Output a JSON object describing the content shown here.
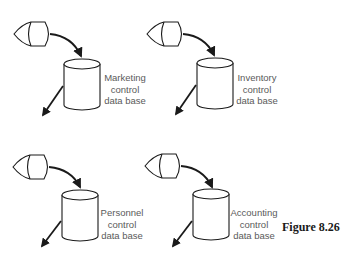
{
  "figure": {
    "caption": "Figure 8.26"
  },
  "groups": [
    {
      "id": "marketing",
      "label_lines": [
        "Marketing",
        "control",
        "data base"
      ],
      "display": {
        "x": 14,
        "y": 21
      },
      "db": {
        "x": 64,
        "y": 58
      },
      "label_pos": {
        "x": 101,
        "y": 72
      }
    },
    {
      "id": "inventory",
      "label_lines": [
        "Inventory",
        "control",
        "data base"
      ],
      "display": {
        "x": 147,
        "y": 21
      },
      "db": {
        "x": 197,
        "y": 57
      },
      "label_pos": {
        "x": 234,
        "y": 72
      }
    },
    {
      "id": "personnel",
      "label_lines": [
        "Personnel",
        "control",
        "data base"
      ],
      "display": {
        "x": 13,
        "y": 154
      },
      "db": {
        "x": 62,
        "y": 189
      },
      "label_pos": {
        "x": 99,
        "y": 208
      }
    },
    {
      "id": "accounting",
      "label_lines": [
        "Accounting",
        "control",
        "data base"
      ],
      "display": {
        "x": 145,
        "y": 153
      },
      "db": {
        "x": 193,
        "y": 188
      },
      "label_pos": {
        "x": 230,
        "y": 208
      }
    }
  ],
  "icons": {
    "display": "display-terminal-icon",
    "database": "database-cylinder-icon",
    "arrow": "arrow-icon"
  },
  "colors": {
    "stroke": "#1a1a1a",
    "label_text": "#5a5a5a",
    "background": "#ffffff"
  }
}
